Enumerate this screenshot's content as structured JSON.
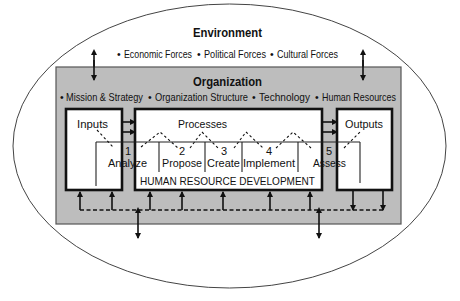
{
  "environment": {
    "title": "Environment",
    "bullet": "•",
    "forces": [
      "Economic Forces",
      "Political Forces",
      "Cultural Forces"
    ]
  },
  "organization": {
    "title": "Organization",
    "bullet": "•",
    "factors": [
      "Mission & Strategy",
      "Organization Structure",
      "Technology",
      "Human Resources"
    ]
  },
  "inputs": {
    "label": "Inputs"
  },
  "processes": {
    "label": "Processes"
  },
  "outputs": {
    "label": "Outputs"
  },
  "hrd": {
    "label": "HUMAN RESOURCE DEVELOPMENT",
    "steps": [
      {
        "number": "1",
        "label": "Analyze"
      },
      {
        "number": "2",
        "label": "Propose"
      },
      {
        "number": "3",
        "label": "Create"
      },
      {
        "number": "4",
        "label": "Implement"
      },
      {
        "number": "5",
        "label": "Assess"
      }
    ]
  },
  "colors": {
    "organization_fill": "#bdbdbd",
    "line": "#111111",
    "background": "#ffffff"
  }
}
